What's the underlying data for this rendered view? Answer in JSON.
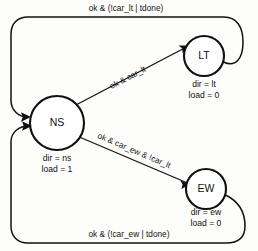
{
  "diagram": {
    "kind": "state-transition-diagram",
    "title": "",
    "background_color": "#fdfdfc",
    "line_color": "#111111",
    "states": [
      {
        "id": "ns",
        "label": "NS",
        "outputs": [
          "dir = ns",
          "load = 1"
        ],
        "cx": 57,
        "cy": 123,
        "r": 27
      },
      {
        "id": "lt",
        "label": "LT",
        "outputs": [
          "dir = lt",
          "load = 0"
        ],
        "cx": 204,
        "cy": 56,
        "r": 20
      },
      {
        "id": "ew",
        "label": "EW",
        "outputs": [
          "dir = ew",
          "load = 0"
        ],
        "cx": 206,
        "cy": 189,
        "r": 20
      }
    ],
    "transitions": [
      {
        "id": "lt-to-ns",
        "from": "lt",
        "to": "ns",
        "label": "ok & (!car_lt | tdone)"
      },
      {
        "id": "ns-to-lt",
        "from": "ns",
        "to": "lt",
        "label": "ok & car_lt"
      },
      {
        "id": "ns-to-ew",
        "from": "ns",
        "to": "ew",
        "label": "ok & car_ew & !car_lt"
      },
      {
        "id": "ew-to-ns",
        "from": "ew",
        "to": "ns",
        "label": "ok & (!car_ew | tdone)"
      }
    ]
  }
}
